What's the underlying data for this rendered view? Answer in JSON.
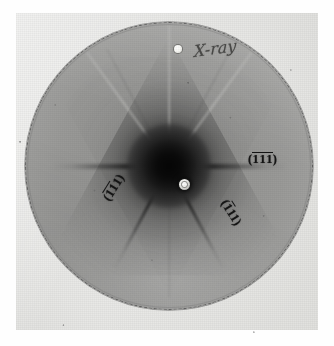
{
  "figure": {
    "kind": "x-ray-laue-diffraction-photograph",
    "medium": "photographic print of circular film",
    "symmetry": "three-fold",
    "page_background": "#ffffff",
    "print_background": "#e9e9e7",
    "film_gray": "#9a9a98",
    "core_black": "#050505"
  },
  "annotations": {
    "handwriting": "X-ray",
    "marker_dot": "white-reference-dot",
    "beam_stop": "beam-stop-bright-center"
  },
  "labels": [
    {
      "id": "right",
      "position": "right-of-center",
      "open_paren": "(",
      "close_paren": ")",
      "indices": [
        "1",
        "1",
        "1"
      ],
      "overbars": [
        true,
        true,
        true
      ],
      "plain": "(-1-1-1)",
      "rotation_deg": 0
    },
    {
      "id": "lower-left",
      "position": "lower-left-of-center",
      "open_paren": "(",
      "close_paren": ")",
      "indices": [
        "1",
        "1",
        "1"
      ],
      "overbars": [
        true,
        true,
        false
      ],
      "plain": "(-1-11)",
      "rotation_deg": -58
    },
    {
      "id": "lower-right",
      "position": "lower-right-of-center",
      "open_paren": "(",
      "close_paren": ")",
      "indices": [
        "1",
        "1",
        "1"
      ],
      "overbars": [
        true,
        false,
        false
      ],
      "plain": "(-111)",
      "rotation_deg": 58
    }
  ],
  "geometry": {
    "film_center_x": 169,
    "film_center_y": 172,
    "film_radius": 144,
    "streak_angles_deg": [
      0,
      180,
      62,
      118
    ],
    "triangle_apex": "up"
  }
}
